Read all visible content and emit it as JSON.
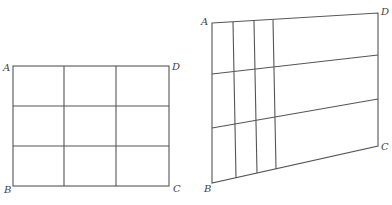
{
  "figures": [
    {
      "id": "left-grid",
      "description": "Rectangle ABCD divided into a 3x3 grid",
      "labels": {
        "A": "A",
        "B": "B",
        "C": "C",
        "D": "D"
      },
      "corners": {
        "A": [
          13,
          66
        ],
        "D": [
          169,
          66
        ],
        "C": [
          169,
          186
        ],
        "B": [
          13,
          186
        ]
      },
      "vertical_lines_x": [
        64,
        116
      ],
      "horizontal_lines_y": [
        106,
        146
      ]
    },
    {
      "id": "right-quad",
      "description": "Quadrilateral ABCD divided by 3 near-vertical lines and 2 slanted lines",
      "labels": {
        "A": "A",
        "B": "B",
        "C": "C",
        "D": "D"
      },
      "corners": {
        "A": [
          212,
          23
        ],
        "D": [
          378,
          13
        ],
        "C": [
          378,
          146
        ],
        "B": [
          212,
          183
        ]
      },
      "vertical_lines": [
        [
          [
            233,
            22
          ],
          [
            236,
            178
          ]
        ],
        [
          [
            254,
            21
          ],
          [
            257,
            173
          ]
        ],
        [
          [
            273,
            20
          ],
          [
            276,
            169
          ]
        ]
      ],
      "horizontal_lines": [
        [
          [
            212,
            74
          ],
          [
            378,
            55
          ]
        ],
        [
          [
            212,
            128
          ],
          [
            378,
            99
          ]
        ]
      ]
    }
  ]
}
